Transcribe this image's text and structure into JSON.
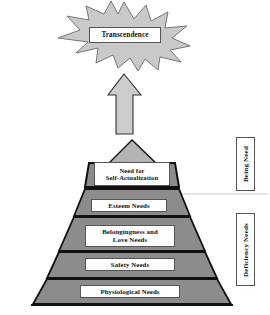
{
  "diagram": {
    "type": "pyramid-hierarchy"
  },
  "transcendence": {
    "label": "Transcendence",
    "shape": "starburst",
    "fill": "#c9c9c9",
    "stroke": "#6b6b6b"
  },
  "arrow": {
    "name": "upward-arrow",
    "fill": "#cccccc",
    "stroke": "#333333"
  },
  "apex": {
    "name": "pyramid-apex-triangle",
    "fill": "#b4b4b4",
    "stroke": "#111111"
  },
  "pyramid": {
    "fill": "#8c8c8c",
    "stroke": "#111111",
    "tiers": [
      {
        "key": "self_actualization",
        "label": "Need for\nSelf-Actualization",
        "line1": "Need for",
        "line2": "Self-Actualization"
      },
      {
        "key": "esteem",
        "label": "Esteem Needs"
      },
      {
        "key": "belongingness",
        "label": "Belongingness and Love Needs",
        "line1": "Belongingness and",
        "line2": "Love Needs"
      },
      {
        "key": "safety",
        "label": "Safety Needs"
      },
      {
        "key": "physiological",
        "label": "Physiological Needs"
      }
    ]
  },
  "side_labels": [
    {
      "key": "being",
      "label": "Being Need"
    },
    {
      "key": "deficiency",
      "label": "Deficiency Needs"
    }
  ],
  "divider": {
    "name": "being-deficiency-divider",
    "color": "#c6c6c6"
  },
  "colors": {
    "background": "#ffffff",
    "pyramid_fill": "#8c8c8c",
    "burst_fill": "#c9c9c9",
    "apex_fill": "#b4b4b4",
    "arrow_fill": "#cccccc",
    "outline": "#111111",
    "box_border": "#555555",
    "text": "#111111"
  }
}
